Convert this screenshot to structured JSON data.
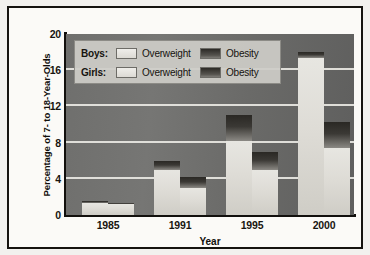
{
  "chart_data": {
    "type": "bar",
    "title": "",
    "subtitle": "",
    "xlabel": "Year",
    "ylabel": "Percentage of 7- to 18-Year-Olds",
    "categories": [
      "1985",
      "1991",
      "1995",
      "2000"
    ],
    "ylim": [
      0,
      20
    ],
    "yticks": [
      0,
      4,
      8,
      12,
      16,
      20
    ],
    "grid": true,
    "grid_axis": "y",
    "legend_position": "top-left-inside",
    "stacked": true,
    "series": [
      {
        "name": "Boys: Overweight",
        "group": "Boys",
        "segment": "Overweight",
        "values": [
          1.3,
          5.0,
          8.2,
          17.4
        ]
      },
      {
        "name": "Boys: Obesity",
        "group": "Boys",
        "segment": "Obesity",
        "values": [
          0.2,
          1.0,
          2.8,
          0.6
        ]
      },
      {
        "name": "Girls: Overweight",
        "group": "Girls",
        "segment": "Overweight",
        "values": [
          1.2,
          3.0,
          5.0,
          7.4
        ]
      },
      {
        "name": "Girls: Obesity",
        "group": "Girls",
        "segment": "Obesity",
        "values": [
          0.1,
          1.2,
          2.0,
          2.9
        ]
      }
    ],
    "totals": {
      "boys": [
        1.5,
        6.0,
        11.0,
        18.0
      ],
      "girls": [
        1.3,
        4.2,
        7.0,
        10.3
      ]
    }
  },
  "axes": {
    "y_label": "Percentage of 7- to 18-Year-Olds",
    "x_label": "Year",
    "y_tick_labels": [
      "0",
      "4",
      "8",
      "12",
      "16",
      "20"
    ],
    "x_tick_labels": [
      "1985",
      "1991",
      "1995",
      "2000"
    ]
  },
  "legend": {
    "rows": [
      {
        "name": "Boys:",
        "overweight_label": "Overweight",
        "obesity_label": "Obesity"
      },
      {
        "name": "Girls:",
        "overweight_label": "Overweight",
        "obesity_label": "Obesity"
      }
    ]
  },
  "colors": {
    "plot_background": "#6f6f6d",
    "gridline": "#e9e8e3",
    "overweight": "#dedcd6",
    "obesity": "#2f2d29",
    "axis": "#12100d",
    "frame": "#15130f",
    "legend_background": "#cdccc7"
  }
}
